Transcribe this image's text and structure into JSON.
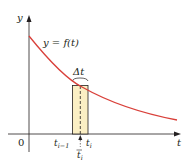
{
  "diagram": {
    "title": "",
    "curve_label": "y = f(t)",
    "y_axis_label": "y",
    "x_axis_label": "t",
    "origin_label": "0",
    "delta_label": "Δt",
    "tick_labels": {
      "left": "t",
      "left_sub": "i−1",
      "right": "t",
      "right_sub": "i",
      "mid": "t",
      "mid_sub": "i"
    },
    "colors": {
      "curve": "#d9403a",
      "rect_fill": "#fbefc4",
      "rect_stroke": "#231f20",
      "axis": "#231f20"
    }
  }
}
